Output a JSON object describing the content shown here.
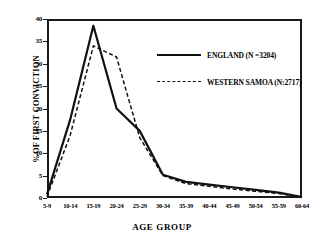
{
  "chart_data": {
    "type": "line",
    "title": "",
    "xlabel": "AGE GROUP",
    "ylabel": "%OF FIRST CONVICTION",
    "categories": [
      "5-9",
      "10-14",
      "15-19",
      "20-24",
      "25-29",
      "30-34",
      "35-39",
      "40-44",
      "45-49",
      "50-54",
      "55-59",
      "60-64"
    ],
    "ylim": [
      0,
      40
    ],
    "ytick_step": 5,
    "yticks": [
      "0",
      "5",
      "10",
      "15",
      "20",
      "25",
      "30",
      "35",
      "40"
    ],
    "grid": false,
    "legend_position": "upper-right-inside",
    "series": [
      {
        "name": "ENGLAND (N =3204)",
        "style": "solid",
        "color": "#111111",
        "values": [
          0.8,
          17.5,
          38.5,
          20.0,
          15.0,
          5.2,
          3.6,
          3.0,
          2.4,
          1.8,
          1.2,
          0.2
        ]
      },
      {
        "name": "WESTERN SAMOA (N:2717)",
        "style": "dashed",
        "color": "#111111",
        "values": [
          0.3,
          14.0,
          34.0,
          31.5,
          13.5,
          5.0,
          3.2,
          2.6,
          2.0,
          1.5,
          1.0,
          0.2
        ]
      }
    ]
  },
  "legend": {
    "items": [
      {
        "label": "ENGLAND (N =3204)",
        "swatch": "solid-line-swatch"
      },
      {
        "label": "WESTERN SAMOA (N:2717)",
        "swatch": "dashed-line-swatch"
      }
    ]
  }
}
